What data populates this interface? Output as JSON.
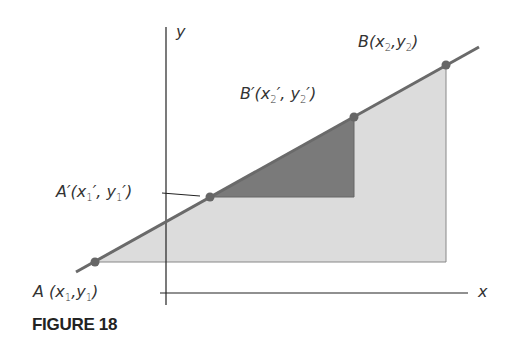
{
  "figure": {
    "caption": "FIGURE 18",
    "axes": {
      "x_label": "x",
      "y_label": "y"
    },
    "points": {
      "A": {
        "name": "A",
        "coords": "(x1,y1)"
      },
      "A_prime": {
        "name": "A′",
        "coords": "(x1′, y1′)"
      },
      "B_prime": {
        "name": "B′",
        "coords": "(x2′, y2′)"
      },
      "B": {
        "name": "B",
        "coords": "(x2,y2)"
      }
    },
    "colors": {
      "line": "#6a6a6a",
      "large_triangle": "#dcdcdc",
      "small_triangle": "#7a7a7a",
      "axis": "#222222"
    }
  }
}
